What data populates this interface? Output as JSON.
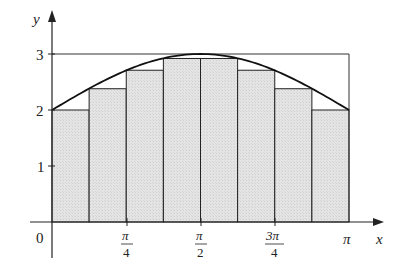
{
  "chart_data": {
    "type": "bar",
    "subtype": "riemann-lower-sum",
    "title": "",
    "function": "f(x) = 2 + sin x",
    "n_subintervals": 8,
    "x_range": [
      0,
      3.14159
    ],
    "ylim": [
      0,
      3
    ],
    "xlabel": "x",
    "ylabel": "y",
    "categories": [
      "[0, π/8]",
      "[π/8, π/4]",
      "[π/4, 3π/8]",
      "[3π/8, π/2]",
      "[π/2, 5π/8]",
      "[5π/8, 3π/4]",
      "[3π/4, 7π/8]",
      "[7π/8, π]"
    ],
    "values": [
      2.0,
      2.38,
      2.71,
      2.92,
      2.92,
      2.71,
      2.38,
      2.0
    ],
    "curve": {
      "name": "y = 2 + sin x",
      "x0": 0,
      "x1": 3.14159
    },
    "bounding_line": {
      "y": 3,
      "x_from": 0,
      "x_to": 3.14159
    },
    "x_ticks": [
      {
        "value": 0,
        "label": "0"
      },
      {
        "value": 0.7854,
        "label_num": "π",
        "label_den": "4"
      },
      {
        "value": 1.5708,
        "label_num": "π",
        "label_den": "2"
      },
      {
        "value": 2.3562,
        "label_num": "3π",
        "label_den": "4"
      },
      {
        "value": 3.14159,
        "label": "π"
      }
    ],
    "y_ticks": [
      {
        "value": 1,
        "label": "1"
      },
      {
        "value": 2,
        "label": "2"
      },
      {
        "value": 3,
        "label": "3"
      }
    ],
    "grid": false,
    "legend": null,
    "colors": {
      "fill": "#e2e2e2",
      "stroke": "#222222",
      "curve": "#111111"
    }
  },
  "labels": {
    "origin": "0",
    "x_axis": "x",
    "y_axis": "y",
    "pi": "π",
    "pi_over_4_num": "π",
    "pi_over_4_den": "4",
    "pi_over_2_num": "π",
    "pi_over_2_den": "2",
    "three_pi_over_4_num": "3π",
    "three_pi_over_4_den": "4",
    "y1": "1",
    "y2": "2",
    "y3": "3"
  }
}
